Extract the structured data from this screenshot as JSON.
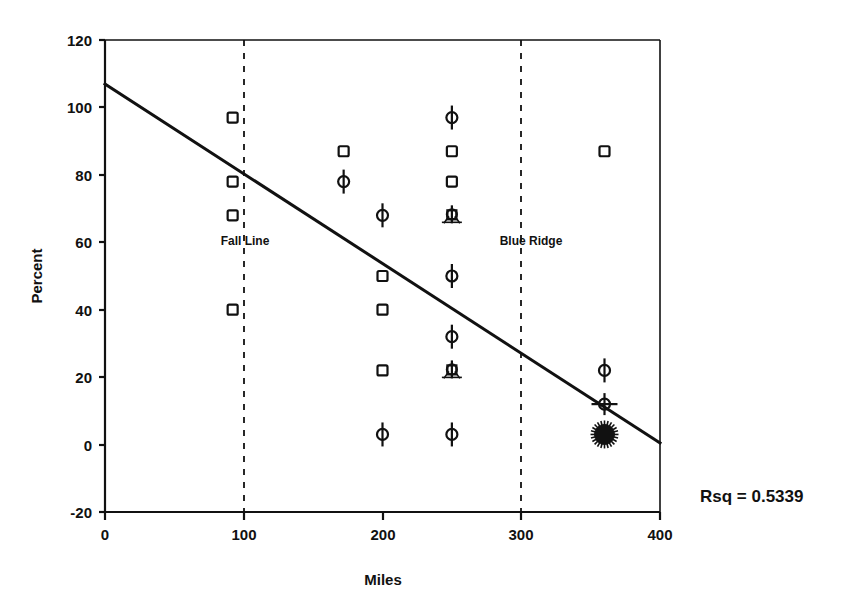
{
  "chart_data": {
    "type": "scatter",
    "title": "",
    "xlabel": "Miles",
    "ylabel": "Percent",
    "xlim": [
      0,
      400
    ],
    "ylim": [
      -20,
      120
    ],
    "xticks": [
      0,
      100,
      200,
      300,
      400
    ],
    "yticks": [
      -20,
      0,
      20,
      40,
      60,
      80,
      100,
      120
    ],
    "xtick_labels": [
      "0",
      "100",
      "200",
      "300",
      "400"
    ],
    "ytick_labels": [
      "-20",
      "0",
      "20",
      "40",
      "60",
      "80",
      "100",
      "120"
    ],
    "grid": false,
    "legend": "none",
    "series": [
      {
        "name": "observations",
        "points": [
          {
            "x": 92,
            "y": 97,
            "marker": "square"
          },
          {
            "x": 92,
            "y": 78,
            "marker": "square"
          },
          {
            "x": 92,
            "y": 68,
            "marker": "square"
          },
          {
            "x": 92,
            "y": 40,
            "marker": "square"
          },
          {
            "x": 172,
            "y": 87,
            "marker": "square"
          },
          {
            "x": 172,
            "y": 78,
            "marker": "circle-bar"
          },
          {
            "x": 200,
            "y": 68,
            "marker": "circle-bar"
          },
          {
            "x": 200,
            "y": 50,
            "marker": "square"
          },
          {
            "x": 200,
            "y": 40,
            "marker": "square"
          },
          {
            "x": 200,
            "y": 22,
            "marker": "square"
          },
          {
            "x": 200,
            "y": 3,
            "marker": "circle-bar"
          },
          {
            "x": 250,
            "y": 97,
            "marker": "circle-bar"
          },
          {
            "x": 250,
            "y": 87,
            "marker": "square"
          },
          {
            "x": 250,
            "y": 78,
            "marker": "square"
          },
          {
            "x": 250,
            "y": 68,
            "marker": "cluster"
          },
          {
            "x": 250,
            "y": 50,
            "marker": "circle-bar"
          },
          {
            "x": 250,
            "y": 32,
            "marker": "circle-bar"
          },
          {
            "x": 250,
            "y": 22,
            "marker": "cluster"
          },
          {
            "x": 250,
            "y": 3,
            "marker": "circle-bar"
          },
          {
            "x": 360,
            "y": 87,
            "marker": "square"
          },
          {
            "x": 360,
            "y": 22,
            "marker": "circle-bar"
          },
          {
            "x": 360,
            "y": 12,
            "marker": "circle-cross"
          },
          {
            "x": 360,
            "y": 3,
            "marker": "dense-blob"
          }
        ]
      }
    ],
    "fit_line": {
      "name": "regression-line",
      "x_start": 0,
      "y_start": 107,
      "x_end": 400,
      "y_end": 1.5
    },
    "reference_lines": [
      {
        "name": "Fall Line",
        "x": 100,
        "label_x": 100,
        "label_y": 60
      },
      {
        "name": "Blue Ridge",
        "x": 300,
        "label_x": 300,
        "label_y": 60
      }
    ],
    "annotations": [
      {
        "name": "rsq",
        "text": "Rsq = 0.5339"
      }
    ]
  },
  "labels": {
    "fall_line": "Fall Line",
    "blue_ridge": "Blue Ridge",
    "rsq": "Rsq = 0.5339",
    "x_title": "Miles",
    "y_title": "Percent"
  }
}
